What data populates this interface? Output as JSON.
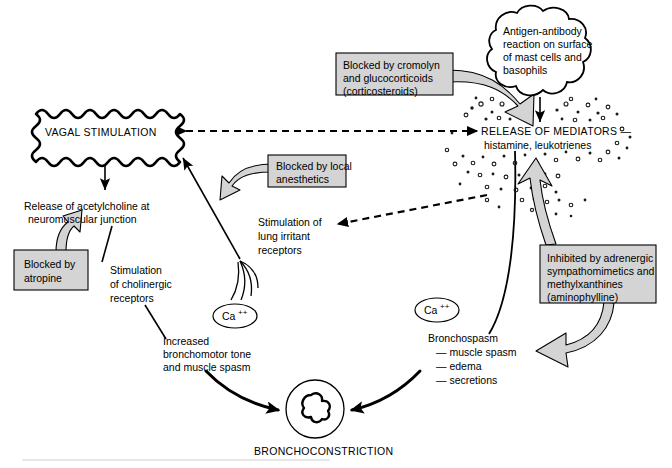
{
  "diagram": {
    "colors": {
      "callout_fill": "#d4d4d4",
      "stroke": "#000000",
      "background": "#ffffff"
    },
    "nodes": {
      "vagal_stimulation": "VAGAL STIMULATION",
      "acetylcholine_line1": "Release of acetylcholine at",
      "acetylcholine_line2": "neuromuscular junction",
      "cholinergic_line1": "Stimulation",
      "cholinergic_line2": "of cholinergic",
      "cholinergic_line3": "receptors",
      "bronchomotor_line1": "Increased",
      "bronchomotor_line2": "bronchomotor tone",
      "bronchomotor_line3": "and muscle spasm",
      "lung_irritant_line1": "Stimulation of",
      "lung_irritant_line2": "lung irritant",
      "lung_irritant_line3": "receptors",
      "antigen_line1": "Antigen-antibody",
      "antigen_line2": "reaction on surface",
      "antigen_line3": "of mast cells and",
      "antigen_line4": "basophils",
      "mediators_line1": "RELEASE OF MEDIATORS —",
      "mediators_line2": "histamine, leukotrienes",
      "bronchospasm_line1": "Bronchospasm",
      "bronchospasm_line2": "— muscle spasm",
      "bronchospasm_line3": "— edema",
      "bronchospasm_line4": "— secretions",
      "bronchoconstriction": "BRONCHOCONSTRICTION",
      "calcium_left": "Ca",
      "calcium_left_charge": "++",
      "calcium_right": "Ca",
      "calcium_right_charge": "++"
    },
    "callouts": {
      "atropine_line1": "Blocked by",
      "atropine_line2": "atropine",
      "local_anesthetics_line1": "Blocked by local",
      "local_anesthetics_line2": "anesthetics",
      "cromolyn_line1": "Blocked by cromolyn",
      "cromolyn_line2": "and glucocorticoids",
      "cromolyn_line3": "(corticosteroids)",
      "adrenergic_line1": "Inhibited by adrenergic",
      "adrenergic_line2": "sympathomimetics and",
      "adrenergic_line3": "methylxanthines",
      "adrenergic_line4": "(aminophylline)"
    }
  }
}
